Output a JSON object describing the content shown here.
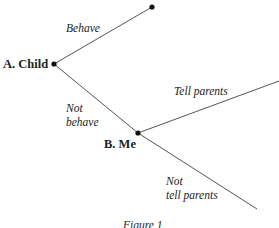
{
  "diagram": {
    "type": "game-tree",
    "nodes": [
      {
        "id": "A",
        "label": "A. Child"
      },
      {
        "id": "B",
        "label": "B. Me"
      },
      {
        "id": "T1",
        "label": ""
      }
    ],
    "edges": [
      {
        "from": "A",
        "to": "T1",
        "label": "Behave"
      },
      {
        "from": "A",
        "to": "B",
        "label_line1": "Not",
        "label_line2": "behave"
      },
      {
        "from": "B",
        "to": "T2",
        "label": "Tell parents"
      },
      {
        "from": "B",
        "to": "T3",
        "label_line1": "Not",
        "label_line2": "tell parents"
      }
    ],
    "caption": "Figure 1",
    "colors": {
      "line": "#555555",
      "node": "#111111",
      "text": "#222222"
    }
  }
}
